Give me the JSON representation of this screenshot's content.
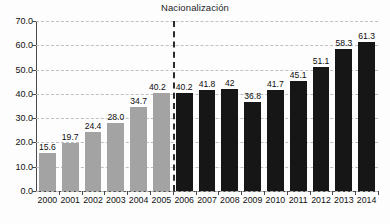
{
  "chart_data": {
    "type": "bar",
    "title": "Nacionalización",
    "xlabel": "",
    "ylabel": "",
    "ylim": [
      0,
      70
    ],
    "ytick_step": 10,
    "ytick_labels": [
      "0.0",
      "10.0",
      "20.0",
      "30.0",
      "40.0",
      "50.0",
      "60.0",
      "70.0"
    ],
    "grid": true,
    "legend": "none",
    "categories": [
      "2000",
      "2001",
      "2002",
      "2003",
      "2004",
      "2005",
      "2006",
      "2007",
      "2008",
      "2009",
      "2010",
      "2011",
      "2012",
      "2013",
      "2014"
    ],
    "values": [
      15.6,
      19.7,
      24.4,
      28.0,
      34.7,
      40.2,
      40.2,
      41.8,
      42,
      36.8,
      41.7,
      45.1,
      51.1,
      58.3,
      61.3
    ],
    "value_labels": [
      "15.6",
      "19.7",
      "24.4",
      "28.0",
      "34.7",
      "40.2",
      "40.2",
      "41.8",
      "42",
      "36.8",
      "41.7",
      "45.1",
      "51.1",
      "58.3",
      "61.3"
    ],
    "bar_groups": [
      "pre",
      "pre",
      "pre",
      "pre",
      "pre",
      "pre",
      "post",
      "post",
      "post",
      "post",
      "post",
      "post",
      "post",
      "post",
      "post"
    ],
    "colors": {
      "pre": "#a3a3a3",
      "post": "#161616",
      "gridline": "#bdbdbd",
      "axis": "#4a4a4a",
      "background": "#fdfdfd",
      "text": "#111111"
    },
    "annotations": [
      {
        "name": "nacionalizacion-divider",
        "label": "Nacionalización",
        "type": "vertical-dashed-line",
        "between": [
          "2005",
          "2006"
        ]
      }
    ]
  }
}
